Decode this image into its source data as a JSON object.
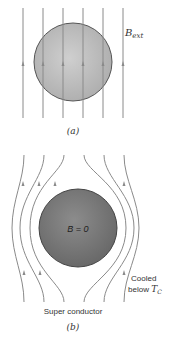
{
  "panel_a": {
    "caption": "(a)",
    "field_label_main": "B",
    "field_label_sub": "ext",
    "sphere_color": "#b9b9b9",
    "line_color": "#8a8a8a"
  },
  "panel_b": {
    "caption": "(b)",
    "inside_label": "B = 0",
    "material_label": "Super conductor",
    "condition_line1": "Cooled",
    "condition_line2_prefix": "below ",
    "condition_symbol_main": "T",
    "condition_symbol_sub": "C",
    "sphere_color": "#7a7a7a",
    "line_color": "#8a8a8a"
  }
}
